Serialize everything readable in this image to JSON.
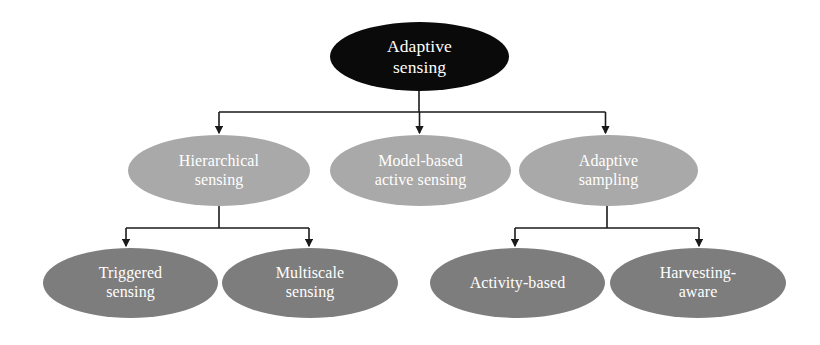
{
  "figure": {
    "kind": "hierarchy-tree-diagram",
    "width": 820,
    "height": 345,
    "background_color": "#ffffff",
    "connector_color": "#1a1a1a"
  },
  "palette": {
    "root_fill": "#0a0a0a",
    "level2_fill": "#a9a9a9",
    "level3_fill": "#7d7d7d",
    "node_text": "#ffffff"
  },
  "nodes": {
    "root": {
      "label": "Adaptive\nsensing",
      "text_plain": "Adaptive sensing",
      "level": 1
    },
    "level2": [
      {
        "label": "Hierarchical\nsensing",
        "text_plain": "Hierarchical sensing",
        "level": 2
      },
      {
        "label": "Model-based\nactive sensing",
        "text_plain": "Model-based active sensing",
        "level": 2
      },
      {
        "label": "Adaptive\nsampling",
        "text_plain": "Adaptive sampling",
        "level": 2
      }
    ],
    "level3": [
      {
        "label": "Triggered\nsensing",
        "text_plain": "Triggered sensing",
        "level": 3,
        "parent": "Hierarchical sensing"
      },
      {
        "label": "Multiscale\nsensing",
        "text_plain": "Multiscale sensing",
        "level": 3,
        "parent": "Hierarchical sensing"
      },
      {
        "label": "Activity-based",
        "text_plain": "Activity-based",
        "level": 3,
        "parent": "Adaptive sampling"
      },
      {
        "label": "Harvesting-\naware",
        "text_plain": "Harvesting-aware",
        "level": 3,
        "parent": "Adaptive sampling"
      }
    ]
  },
  "edges": [
    {
      "from": "Adaptive sensing",
      "to": "Hierarchical sensing"
    },
    {
      "from": "Adaptive sensing",
      "to": "Model-based active sensing"
    },
    {
      "from": "Adaptive sensing",
      "to": "Adaptive sampling"
    },
    {
      "from": "Hierarchical sensing",
      "to": "Triggered sensing"
    },
    {
      "from": "Hierarchical sensing",
      "to": "Multiscale sensing"
    },
    {
      "from": "Adaptive sampling",
      "to": "Activity-based"
    },
    {
      "from": "Adaptive sampling",
      "to": "Harvesting-aware"
    }
  ]
}
